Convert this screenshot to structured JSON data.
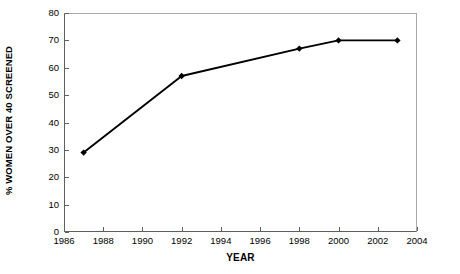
{
  "chart_data": {
    "type": "line",
    "title": "",
    "title_remnant": "",
    "xlabel": "YEAR",
    "ylabel": "% WOMEN OVER 40 SCREENED",
    "xlim": [
      1986,
      2004
    ],
    "ylim": [
      0,
      80
    ],
    "xticks": [
      1986,
      1988,
      1990,
      1992,
      1994,
      1996,
      1998,
      2000,
      2002,
      2004
    ],
    "yticks": [
      0,
      10,
      20,
      30,
      40,
      50,
      60,
      70,
      80
    ],
    "xtick_labels": [
      "1986",
      "1988",
      "1990",
      "1992",
      "1994",
      "1996",
      "1998",
      "2000",
      "2002",
      "2004"
    ],
    "ytick_labels": [
      "0",
      "10",
      "20",
      "30",
      "40",
      "50",
      "60",
      "70",
      "80"
    ],
    "grid": false,
    "legend": false,
    "legend_position": "none",
    "marker": "diamond",
    "line_color": "#000000",
    "marker_color": "#000000",
    "x": [
      1987,
      1992,
      1998,
      2000,
      2003
    ],
    "values": [
      29,
      57,
      67,
      70,
      70
    ],
    "points": [
      {
        "x": 1987,
        "y": 29
      },
      {
        "x": 1992,
        "y": 57
      },
      {
        "x": 1998,
        "y": 67
      },
      {
        "x": 2000,
        "y": 70
      },
      {
        "x": 2003,
        "y": 70
      }
    ],
    "series": [
      {
        "name": "% women over 40 screened",
        "x": [
          1987,
          1992,
          1998,
          2000,
          2003
        ],
        "values": [
          29,
          57,
          67,
          70,
          70
        ]
      }
    ]
  }
}
